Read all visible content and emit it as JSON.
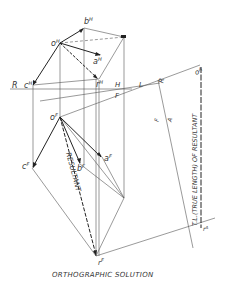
{
  "caption": "ORTHOGRAPHIC SOLUTION",
  "labels": {
    "bH": "b",
    "bH_sup": "H",
    "oH": "o",
    "oH_sup": "H",
    "aH": "a",
    "aH_sup": "H",
    "rH": "r",
    "rH_sup": "H",
    "cH": "c",
    "cH_sup": "H",
    "R1": "R",
    "H": "H",
    "F": "F",
    "L": "L",
    "R2": "R",
    "oA": "o",
    "oA_sup": "A",
    "oF": "o",
    "oF_sup": "F",
    "cF": "c",
    "cF_sup": "F",
    "bF": "b",
    "bF_sup": "F",
    "aF": "a",
    "aF_sup": "F",
    "rF": "r",
    "rF_sup": "F",
    "rA": "r",
    "rA_sup": "A",
    "F2": "F",
    "A": "A",
    "resultant": "RESULTANT",
    "true_length": "T.L.(TRUE LENGTH) OF RESULTANT"
  },
  "colors": {
    "line": "#333333",
    "thin": "#666666"
  }
}
